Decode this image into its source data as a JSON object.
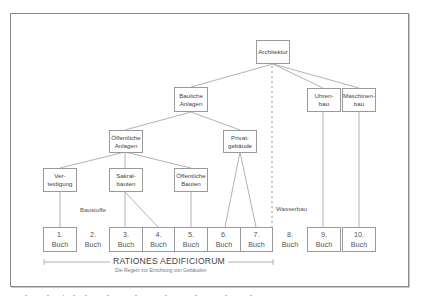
{
  "diagram": {
    "root": {
      "label": "Architektur"
    },
    "level1": [
      {
        "id": "bauliche",
        "label": "Bauliche\nAnlagen"
      },
      {
        "id": "uhrenbau",
        "label": "Uhren-\nbau"
      },
      {
        "id": "maschinenbau",
        "label": "Maschinen-\nbau"
      }
    ],
    "level2": [
      {
        "id": "oeffentliche-anlagen",
        "label": "Öffentliche\nAnlagen"
      },
      {
        "id": "privatgebaeude",
        "label": "Privat-\ngebäude"
      }
    ],
    "level3": [
      {
        "id": "verteidigung",
        "label": "Ver-\nteidigung"
      },
      {
        "id": "sakralbauten",
        "label": "Sakral-\nbauten"
      },
      {
        "id": "oeffentliche-bauten",
        "label": "Öffentliche\nBauten"
      }
    ],
    "books": [
      {
        "label": "1.\nBuch",
        "boxed": true
      },
      {
        "label": "2.\nBuch",
        "boxed": false
      },
      {
        "label": "3.\nBuch",
        "boxed": true
      },
      {
        "label": "4.\nBuch",
        "boxed": true
      },
      {
        "label": "5.\nBuch",
        "boxed": true
      },
      {
        "label": "6.\nBuch",
        "boxed": true
      },
      {
        "label": "7.\nBuch",
        "boxed": true
      },
      {
        "label": "8.\nBuch",
        "boxed": false
      },
      {
        "label": "9.\nBuch",
        "boxed": true
      },
      {
        "label": "10.\nBuch",
        "boxed": true
      }
    ],
    "annotations": {
      "baustoffe": "Baustoffe",
      "wasserbau": "Wasserbau"
    },
    "bracket": {
      "title": "RATIONES AEDIFICIORUM",
      "subtitle": "Die Regeln zur Errichtung von Gebäuden"
    },
    "colors": {
      "line": "#9a9a9a",
      "frame": "#8a8a8a",
      "text": "#444444"
    }
  }
}
